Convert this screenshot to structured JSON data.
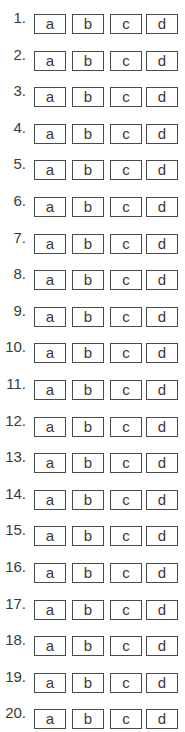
{
  "answer_sheet": {
    "options": [
      "a",
      "b",
      "c",
      "d"
    ],
    "questions": [
      {
        "label": "1.",
        "options": [
          "a",
          "b",
          "c",
          "d"
        ]
      },
      {
        "label": "2.",
        "options": [
          "a",
          "b",
          "c",
          "d"
        ]
      },
      {
        "label": "3.",
        "options": [
          "a",
          "b",
          "c",
          "d"
        ]
      },
      {
        "label": "4.",
        "options": [
          "a",
          "b",
          "c",
          "d"
        ]
      },
      {
        "label": "5.",
        "options": [
          "a",
          "b",
          "c",
          "d"
        ]
      },
      {
        "label": "6.",
        "options": [
          "a",
          "b",
          "c",
          "d"
        ]
      },
      {
        "label": "7.",
        "options": [
          "a",
          "b",
          "c",
          "d"
        ]
      },
      {
        "label": "8.",
        "options": [
          "a",
          "b",
          "c",
          "d"
        ]
      },
      {
        "label": "9.",
        "options": [
          "a",
          "b",
          "c",
          "d"
        ]
      },
      {
        "label": "10.",
        "options": [
          "a",
          "b",
          "c",
          "d"
        ]
      },
      {
        "label": "11.",
        "options": [
          "a",
          "b",
          "c",
          "d"
        ]
      },
      {
        "label": "12.",
        "options": [
          "a",
          "b",
          "c",
          "d"
        ]
      },
      {
        "label": "13.",
        "options": [
          "a",
          "b",
          "c",
          "d"
        ]
      },
      {
        "label": "14.",
        "options": [
          "a",
          "b",
          "c",
          "d"
        ]
      },
      {
        "label": "15.",
        "options": [
          "a",
          "b",
          "c",
          "d"
        ]
      },
      {
        "label": "16.",
        "options": [
          "a",
          "b",
          "c",
          "d"
        ]
      },
      {
        "label": "17.",
        "options": [
          "a",
          "b",
          "c",
          "d"
        ]
      },
      {
        "label": "18.",
        "options": [
          "a",
          "b",
          "c",
          "d"
        ]
      },
      {
        "label": "19.",
        "options": [
          "a",
          "b",
          "c",
          "d"
        ]
      },
      {
        "label": "20.",
        "options": [
          "a",
          "b",
          "c",
          "d"
        ]
      }
    ]
  },
  "colors": {
    "background": "#ffffff",
    "box_border": "#4a4a4a",
    "text": "#3a3a3a"
  }
}
